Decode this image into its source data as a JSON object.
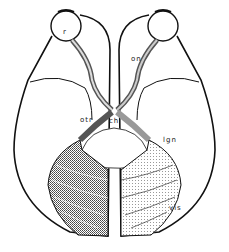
{
  "diagram": {
    "labels": {
      "retina": "r",
      "optic_nerve": "on",
      "optic_tract": "otr",
      "chiasm": "ch",
      "lateral_geniculate": "lgn",
      "visual_cortex": "vis"
    },
    "colors": {
      "ink": "#111111",
      "dark_hatch": "#555555",
      "light_stipple": "#bbbbbb",
      "background": "#ffffff"
    }
  }
}
